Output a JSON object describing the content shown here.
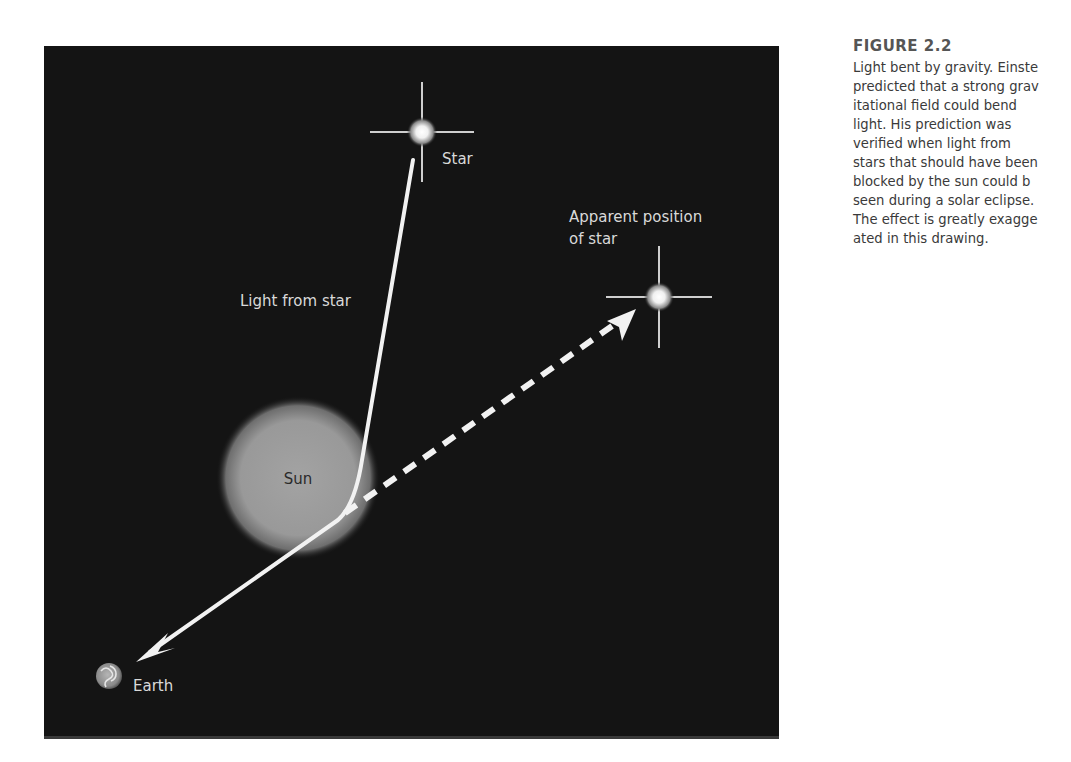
{
  "figure": {
    "title": "FIGURE 2.2",
    "caption_lines": [
      "Light bent by gravity. Einste",
      "predicted that a strong grav",
      "itational field could bend",
      "light. His prediction was",
      "verified when light from",
      "stars that should have been",
      "blocked by the sun could b",
      "seen during a solar eclipse.",
      "The effect is greatly exagge",
      "ated in this drawing."
    ]
  },
  "diagram": {
    "labels": {
      "star": "Star",
      "apparent_line1": "Apparent position",
      "apparent_line2": "of star",
      "light_from_star": "Light from star",
      "sun": "Sun",
      "earth": "Earth"
    },
    "colors": {
      "background": "#141414",
      "light_ray": "#f2f2f2",
      "sun": "#9a9a9a",
      "label": "#d9d9d9"
    },
    "points": {
      "star": [
        422,
        132
      ],
      "apparent_star": [
        659,
        297
      ],
      "sun_center": [
        298,
        478
      ],
      "sun_radius": 70,
      "bend_point": [
        342,
        518
      ],
      "earth": [
        113,
        675
      ]
    }
  }
}
